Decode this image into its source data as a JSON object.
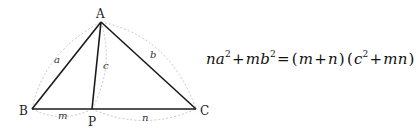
{
  "diagram": {
    "vertices": {
      "A": {
        "label": "A",
        "x": 101,
        "y": 22
      },
      "B": {
        "label": "B",
        "x": 32,
        "y": 109
      },
      "C": {
        "label": "C",
        "x": 196,
        "y": 109
      },
      "P": {
        "label": "P",
        "x": 92,
        "y": 109
      }
    },
    "segment_labels": {
      "a": "a",
      "b": "b",
      "c": "c",
      "m": "m",
      "n": "n"
    },
    "colors": {
      "line": "#1a1a1a",
      "dashed": "#b0b0b0"
    }
  },
  "equation": {
    "parts": [
      "na",
      "2",
      "+",
      "mb",
      "2",
      "=",
      "(",
      "m",
      "+",
      "n",
      ")",
      "(",
      "c",
      "2",
      "+",
      "mn",
      ")"
    ],
    "text": "na² + mb² = (m + n)(c² + mn)"
  }
}
